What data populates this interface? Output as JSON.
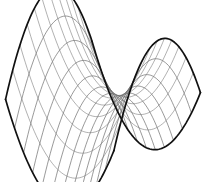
{
  "figure": {
    "kind": "3d-wireframe-surface-plot",
    "surface_equation": "z = x^2 - y^2",
    "canvas": {
      "width": 206,
      "height": 182,
      "background": "#ffffff"
    },
    "projection": {
      "type": "oblique-axonometric",
      "origin_x": 103,
      "origin_y": 96,
      "x_axis": [
        6.45,
        3.05
      ],
      "y_axis": [
        -5.15,
        3.45
      ],
      "z_axis": [
        0,
        -9.6
      ]
    },
    "domain": {
      "u_min": -1,
      "u_max": 1,
      "v_min": -1,
      "v_max": 1
    },
    "mesh": {
      "u_divisions": 13,
      "v_divisions": 13,
      "samples_per_line": 60,
      "line_color": "#5a5a5a",
      "line_width": 0.62,
      "faint_line_color": "#6f6f6f"
    },
    "silhouette": {
      "color": "#111111",
      "width": 1.7,
      "edges": [
        "u-min-edge",
        "u-max-edge",
        "v-min-edge",
        "v-max-edge"
      ]
    },
    "features": [
      {
        "name": "left-peak",
        "label": "high corner (front-left)",
        "u": -1,
        "v": 1
      },
      {
        "name": "right-peak",
        "label": "high corner (back-right)",
        "u": 1,
        "v": -1
      },
      {
        "name": "front-valley",
        "label": "low corner (front-right)",
        "u": 1,
        "v": 1
      },
      {
        "name": "back-valley",
        "label": "low corner (back-left)",
        "u": -1,
        "v": -1
      },
      {
        "name": "saddle-point",
        "label": "saddle point (center)",
        "u": 0,
        "v": 0
      }
    ]
  },
  "chart_data": {
    "type": "surface",
    "subtitle": "",
    "xlabel": "",
    "ylabel": "",
    "zlabel": "",
    "equation": "z = x^2 - y^2",
    "xlim": [
      -1,
      1
    ],
    "ylim": [
      -1,
      1
    ],
    "zlim": [
      -1,
      1
    ],
    "grid": true,
    "legend": false,
    "legend_position": "none",
    "annotations": [],
    "tick_labels": {
      "x": [],
      "y": [],
      "z": []
    },
    "mesh_u_count": 13,
    "mesh_v_count": 13,
    "z_at_corners": {
      "u_min_v_min": 0,
      "u_min_v_max": 0,
      "u_max_v_min": 0,
      "u_max_v_max": 0
    },
    "samples": {
      "u": [
        -1,
        -0.8333,
        -0.6667,
        -0.5,
        -0.3333,
        -0.1667,
        0,
        0.1667,
        0.3333,
        0.5,
        0.6667,
        0.8333,
        1
      ],
      "v": [
        -1,
        -0.8333,
        -0.6667,
        -0.5,
        -0.3333,
        -0.1667,
        0,
        0.1667,
        0.3333,
        0.5,
        0.6667,
        0.8333,
        1
      ],
      "z_rows": [
        [
          0,
          0.3056,
          0.5556,
          0.75,
          0.8889,
          0.9722,
          1,
          0.9722,
          0.8889,
          0.75,
          0.5556,
          0.3056,
          0
        ],
        [
          -0.3056,
          0,
          0.25,
          0.4444,
          0.5833,
          0.6667,
          0.6944,
          0.6667,
          0.5833,
          0.4444,
          0.25,
          0,
          -0.3056
        ],
        [
          -0.5556,
          -0.25,
          0,
          0.1944,
          0.3333,
          0.4167,
          0.4444,
          0.4167,
          0.3333,
          0.1944,
          0,
          -0.25,
          -0.5556
        ],
        [
          -0.75,
          -0.4444,
          -0.1944,
          0,
          0.1389,
          0.2222,
          0.25,
          0.2222,
          0.1389,
          0,
          -0.1944,
          -0.4444,
          -0.75
        ],
        [
          -0.8889,
          -0.5833,
          -0.3333,
          -0.1389,
          0,
          0.0833,
          0.1111,
          0.0833,
          0,
          -0.1389,
          -0.3333,
          -0.5833,
          -0.8889
        ],
        [
          -0.9722,
          -0.6667,
          -0.4167,
          -0.2222,
          -0.0833,
          0,
          0.0278,
          0,
          -0.0833,
          -0.2222,
          -0.4167,
          -0.6667,
          -0.9722
        ],
        [
          -1,
          -0.6944,
          -0.4444,
          -0.25,
          -0.1111,
          -0.0278,
          0,
          -0.0278,
          -0.1111,
          -0.25,
          -0.4444,
          -0.6944,
          -1
        ],
        [
          -0.9722,
          -0.6667,
          -0.4167,
          -0.2222,
          -0.0833,
          0,
          0.0278,
          0,
          -0.0833,
          -0.2222,
          -0.4167,
          -0.6667,
          -0.9722
        ],
        [
          -0.8889,
          -0.5833,
          -0.3333,
          -0.1389,
          0,
          0.0833,
          0.1111,
          0.0833,
          0,
          -0.1389,
          -0.3333,
          -0.5833,
          -0.8889
        ],
        [
          -0.75,
          -0.4444,
          -0.1944,
          0,
          0.1389,
          0.2222,
          0.25,
          0.2222,
          0.1389,
          0,
          -0.1944,
          -0.4444,
          -0.75
        ],
        [
          -0.5556,
          -0.25,
          0,
          0.1944,
          0.3333,
          0.4167,
          0.4444,
          0.4167,
          0.3333,
          0.1944,
          0,
          -0.25,
          -0.5556
        ],
        [
          -0.3056,
          0,
          0.25,
          0.4444,
          0.5833,
          0.6667,
          0.6944,
          0.6667,
          0.5833,
          0.4444,
          0.25,
          0,
          -0.3056
        ],
        [
          0,
          0.3056,
          0.5556,
          0.75,
          0.8889,
          0.9722,
          1,
          0.9722,
          0.8889,
          0.75,
          0.5556,
          0.3056,
          0
        ]
      ]
    }
  }
}
